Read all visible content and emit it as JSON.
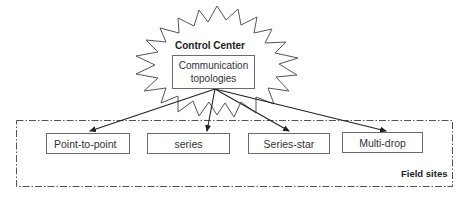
{
  "diagram": {
    "type": "hierarchy",
    "control_center": {
      "title": "Control Center",
      "inner_box": {
        "line1": "Communication",
        "line2": "topologies"
      }
    },
    "field_sites": {
      "label": "Field sites",
      "topologies": [
        {
          "label": "Point-to-point"
        },
        {
          "label": "series"
        },
        {
          "label": "Series-star"
        },
        {
          "label": "Multi-drop"
        }
      ]
    },
    "edges": [
      {
        "from": "Communication topologies",
        "to": "Point-to-point"
      },
      {
        "from": "Communication topologies",
        "to": "series"
      },
      {
        "from": "Communication topologies",
        "to": "Series-star"
      },
      {
        "from": "Communication topologies",
        "to": "Multi-drop"
      }
    ],
    "colors": {
      "stroke": "#555555",
      "text": "#222222",
      "background": "#ffffff"
    }
  }
}
